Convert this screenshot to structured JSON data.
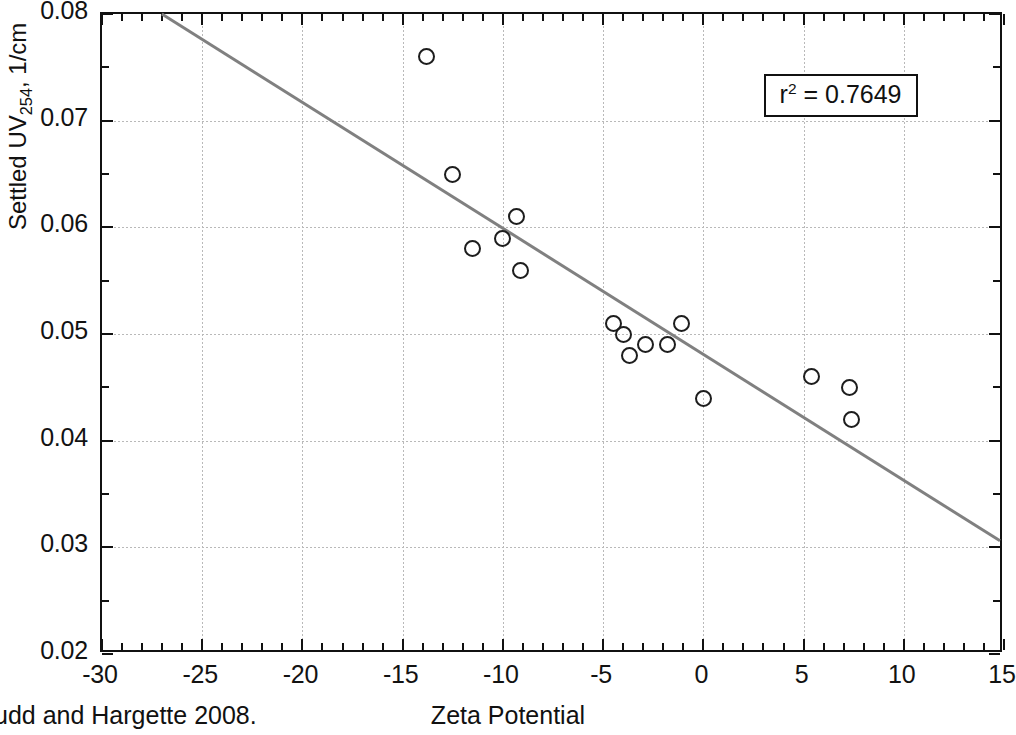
{
  "figure": {
    "caption": "udd and Hargette 2008."
  },
  "chart_data": {
    "type": "scatter",
    "title": "",
    "xlabel": "Zeta Potential",
    "ylabel": "Settled UV254, 1/cm",
    "ylabel_prefix": "Settled UV",
    "ylabel_subscript": "254",
    "ylabel_suffix": ", 1/cm",
    "xlim": [
      -30,
      15
    ],
    "ylim": [
      0.02,
      0.08
    ],
    "xticks": [
      -30,
      -25,
      -20,
      -15,
      -10,
      -5,
      0,
      5,
      10,
      15
    ],
    "xticklabels": [
      "-30",
      "-25",
      "-20",
      "-15",
      "-10",
      "-5",
      "0",
      "5",
      "10",
      "15"
    ],
    "yticks": [
      0.02,
      0.03,
      0.04,
      0.05,
      0.06,
      0.07,
      0.08
    ],
    "yticklabels": [
      "0.02",
      "0.03",
      "0.04",
      "0.05",
      "0.06",
      "0.07",
      "0.08"
    ],
    "x_minor_interval": 1,
    "y_minor_interval": 0.005,
    "grid": true,
    "grid_color": "#b9b9b9",
    "marker": "open-circle",
    "marker_color": "#1d1d1d",
    "legend": "none",
    "points": [
      {
        "x": -13.8,
        "y": 0.076
      },
      {
        "x": -12.5,
        "y": 0.065
      },
      {
        "x": -11.5,
        "y": 0.058
      },
      {
        "x": -10.0,
        "y": 0.059
      },
      {
        "x": -9.3,
        "y": 0.061
      },
      {
        "x": -9.1,
        "y": 0.056
      },
      {
        "x": -4.5,
        "y": 0.051
      },
      {
        "x": -4.0,
        "y": 0.05
      },
      {
        "x": -3.7,
        "y": 0.048
      },
      {
        "x": -2.9,
        "y": 0.049
      },
      {
        "x": -1.8,
        "y": 0.049
      },
      {
        "x": -1.1,
        "y": 0.051
      },
      {
        "x": 0.0,
        "y": 0.044
      },
      {
        "x": 5.4,
        "y": 0.046
      },
      {
        "x": 7.3,
        "y": 0.045
      },
      {
        "x": 7.4,
        "y": 0.042
      }
    ],
    "trendline": {
      "type": "linear",
      "x_start": -27.0,
      "y_start": 0.08,
      "x_end": 15.0,
      "y_end": 0.0303,
      "color": "#808080",
      "width": 3
    },
    "annotation": {
      "text": "r2 = 0.7649",
      "prefix": "r",
      "superscript": "2",
      "suffix": " = 0.7649",
      "value": 0.7649,
      "boxed": true
    }
  }
}
